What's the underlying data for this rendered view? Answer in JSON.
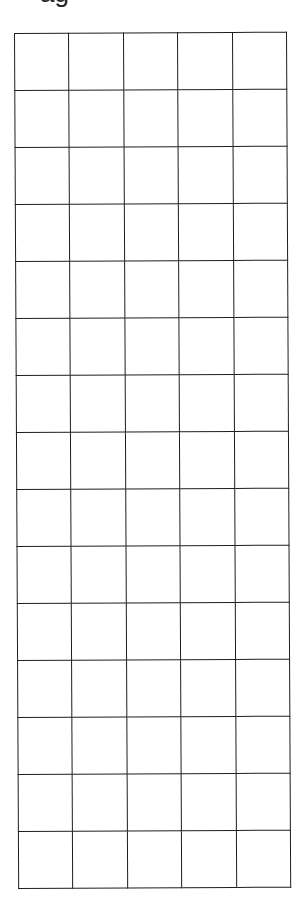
{
  "heading": {
    "text": "ag"
  },
  "grid": {
    "rows": 15,
    "columns": 5,
    "line_color": "#1e1e1e",
    "background_color": "#ffffff",
    "cells": [
      [
        "",
        "",
        "",
        "",
        ""
      ],
      [
        "",
        "",
        "",
        "",
        ""
      ],
      [
        "",
        "",
        "",
        "",
        ""
      ],
      [
        "",
        "",
        "",
        "",
        ""
      ],
      [
        "",
        "",
        "",
        "",
        ""
      ],
      [
        "",
        "",
        "",
        "",
        ""
      ],
      [
        "",
        "",
        "",
        "",
        ""
      ],
      [
        "",
        "",
        "",
        "",
        ""
      ],
      [
        "",
        "",
        "",
        "",
        ""
      ],
      [
        "",
        "",
        "",
        "",
        ""
      ],
      [
        "",
        "",
        "",
        "",
        ""
      ],
      [
        "",
        "",
        "",
        "",
        ""
      ],
      [
        "",
        "",
        "",
        "",
        ""
      ],
      [
        "",
        "",
        "",
        "",
        ""
      ],
      [
        "",
        "",
        "",
        "",
        ""
      ]
    ]
  }
}
